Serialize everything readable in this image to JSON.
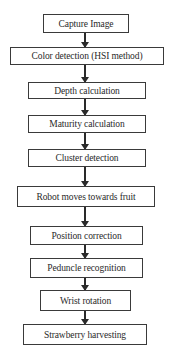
{
  "diagram": {
    "type": "flowchart",
    "direction": "top-to-bottom",
    "steps": [
      {
        "label": "Capture Image"
      },
      {
        "label": "Color detection (HSI method)"
      },
      {
        "label": "Depth calculation"
      },
      {
        "label": "Maturity calculation"
      },
      {
        "label": "Cluster detection"
      },
      {
        "label": "Robot moves towards fruit"
      },
      {
        "label": "Position correction"
      },
      {
        "label": "Peduncle recognition"
      },
      {
        "label": "Wrist rotation"
      },
      {
        "label": "Strawberry harvesting"
      }
    ],
    "colors": {
      "border": "#3a3a3a",
      "text": "#2a2a2a",
      "background": "#ffffff"
    }
  }
}
